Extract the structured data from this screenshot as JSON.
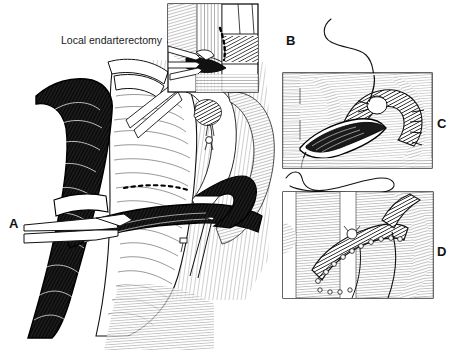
{
  "figure": {
    "type": "line-art-medical-illustration",
    "width": 460,
    "height": 350,
    "background_color": "#ffffff",
    "ink_color": "#000000"
  },
  "captions": {
    "local_endarterectomy": "Local endarterectomy"
  },
  "panel_labels": {
    "a": "A",
    "b": "B",
    "c": "C",
    "d": "D"
  },
  "panels": [
    {
      "id": "a",
      "label": "A",
      "label_x": 9,
      "label_y": 217,
      "kind": "main-illustration",
      "description": "Main operative field: carotid bifurcation with vessel loops, clamped artery held by forceps, dashed arteriotomy line"
    },
    {
      "id": "b",
      "label": "B",
      "label_x": 286,
      "label_y": 34,
      "kind": "inset-box",
      "box": {
        "x": 168,
        "y": 4,
        "width": 90,
        "height": 88
      },
      "caption": "Local endarterectomy",
      "description": "Inset detail: plaque dissection with forceps and dissector, dashed endarterectomy plane"
    },
    {
      "id": "c",
      "label": "C",
      "label_x": 437,
      "label_y": 117,
      "kind": "detail-box",
      "box": {
        "x": 283,
        "y": 73,
        "width": 149,
        "height": 95
      },
      "description": "Detail: arteriotomy opened showing intimal surface, suture with needle entering at top"
    },
    {
      "id": "d",
      "label": "D",
      "label_x": 437,
      "label_y": 245,
      "kind": "detail-box",
      "box": {
        "x": 283,
        "y": 192,
        "width": 150,
        "height": 106
      },
      "description": "Detail: completed running suture closure of arteriotomy"
    }
  ],
  "annotations": {
    "suture_thread_b": "curved suture thread with needle above panel C",
    "suture_thread_loop": "looping suture thread between panels C and D",
    "dashed_incision_line": "dashed arteriotomy incision line"
  }
}
